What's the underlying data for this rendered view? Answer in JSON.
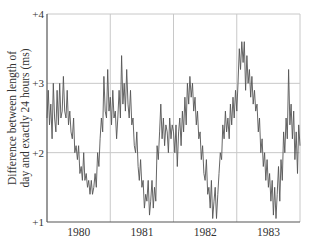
{
  "chart_data": {
    "type": "line",
    "title": "",
    "xlabel": "",
    "ylabel": "Difference between length of day and exactly 24 hours (ms)",
    "ylabel_lines": [
      "Difference between length of",
      "day and exactly 24 hours (ms)"
    ],
    "y_ticks": [
      {
        "value": 4,
        "label": "+4"
      },
      {
        "value": 3,
        "label": "+3"
      },
      {
        "value": 2,
        "label": "+2"
      },
      {
        "value": 1,
        "label": "+1"
      }
    ],
    "x_ticks": [
      {
        "value": 1980.5,
        "label": "1980"
      },
      {
        "value": 1981.5,
        "label": "1981"
      },
      {
        "value": 1982.5,
        "label": "1982"
      },
      {
        "value": 1983.5,
        "label": "1983"
      }
    ],
    "year_gridlines": [
      1981,
      1982,
      1983
    ],
    "xlim": [
      1980.0,
      1984.0
    ],
    "ylim": [
      1,
      4
    ],
    "grid": true,
    "legend": null,
    "series": [
      {
        "name": "Length-of-day excess (ms)",
        "color": "#555555",
        "x": [
          1980.0,
          1980.02,
          1980.04,
          1980.06,
          1980.08,
          1980.1,
          1980.12,
          1980.14,
          1980.16,
          1980.18,
          1980.2,
          1980.22,
          1980.24,
          1980.26,
          1980.28,
          1980.3,
          1980.32,
          1980.34,
          1980.36,
          1980.38,
          1980.4,
          1980.42,
          1980.44,
          1980.46,
          1980.48,
          1980.5,
          1980.52,
          1980.54,
          1980.56,
          1980.58,
          1980.6,
          1980.62,
          1980.64,
          1980.66,
          1980.68,
          1980.7,
          1980.72,
          1980.74,
          1980.76,
          1980.78,
          1980.8,
          1980.82,
          1980.84,
          1980.86,
          1980.88,
          1980.9,
          1980.92,
          1980.94,
          1980.96,
          1980.98,
          1981.0,
          1981.02,
          1981.04,
          1981.06,
          1981.08,
          1981.1,
          1981.12,
          1981.14,
          1981.16,
          1981.18,
          1981.2,
          1981.22,
          1981.24,
          1981.26,
          1981.28,
          1981.3,
          1981.32,
          1981.34,
          1981.36,
          1981.38,
          1981.4,
          1981.42,
          1981.44,
          1981.46,
          1981.48,
          1981.5,
          1981.52,
          1981.54,
          1981.56,
          1981.58,
          1981.6,
          1981.62,
          1981.64,
          1981.66,
          1981.68,
          1981.7,
          1981.72,
          1981.74,
          1981.76,
          1981.78,
          1981.8,
          1981.82,
          1981.84,
          1981.86,
          1981.88,
          1981.9,
          1981.92,
          1981.94,
          1981.96,
          1981.98,
          1982.0,
          1982.02,
          1982.04,
          1982.06,
          1982.08,
          1982.1,
          1982.12,
          1982.14,
          1982.16,
          1982.18,
          1982.2,
          1982.22,
          1982.24,
          1982.26,
          1982.28,
          1982.3,
          1982.32,
          1982.34,
          1982.36,
          1982.38,
          1982.4,
          1982.42,
          1982.44,
          1982.46,
          1982.48,
          1982.5,
          1982.52,
          1982.54,
          1982.56,
          1982.58,
          1982.6,
          1982.62,
          1982.64,
          1982.66,
          1982.68,
          1982.7,
          1982.72,
          1982.74,
          1982.76,
          1982.78,
          1982.8,
          1982.82,
          1982.84,
          1982.86,
          1982.88,
          1982.9,
          1982.92,
          1982.94,
          1982.96,
          1982.98,
          1983.0,
          1983.02,
          1983.04,
          1983.06,
          1983.08,
          1983.1,
          1983.12,
          1983.14,
          1983.16,
          1983.18,
          1983.2,
          1983.22,
          1983.24,
          1983.26,
          1983.28,
          1983.3,
          1983.32,
          1983.34,
          1983.36,
          1983.38,
          1983.4,
          1983.42,
          1983.44,
          1983.46,
          1983.48,
          1983.5,
          1983.52,
          1983.54,
          1983.56,
          1983.58,
          1983.6,
          1983.62,
          1983.64,
          1983.66,
          1983.68,
          1983.7,
          1983.72,
          1983.74,
          1983.76,
          1983.78,
          1983.8,
          1983.82,
          1983.84,
          1983.86,
          1983.88,
          1983.9,
          1983.92,
          1983.94,
          1983.96,
          1983.98,
          1984.0
        ],
        "y": [
          2.5,
          2.9,
          2.4,
          2.7,
          2.2,
          3.0,
          2.5,
          2.3,
          2.9,
          2.4,
          3.0,
          2.5,
          2.6,
          3.1,
          2.6,
          2.5,
          2.9,
          2.4,
          2.6,
          2.3,
          2.2,
          2.5,
          2.0,
          2.1,
          1.9,
          2.1,
          1.7,
          1.8,
          1.6,
          2.0,
          1.6,
          1.7,
          1.5,
          1.6,
          1.4,
          1.6,
          1.4,
          1.5,
          1.7,
          1.5,
          2.0,
          1.8,
          2.2,
          2.5,
          2.3,
          3.1,
          2.6,
          2.5,
          3.2,
          2.6,
          2.8,
          2.4,
          2.9,
          2.5,
          2.6,
          2.2,
          2.5,
          2.9,
          2.5,
          3.4,
          2.7,
          3.0,
          2.6,
          3.2,
          2.7,
          2.5,
          2.9,
          2.4,
          2.5,
          2.1,
          2.0,
          2.3,
          1.8,
          1.6,
          1.9,
          1.5,
          1.6,
          1.2,
          1.4,
          1.3,
          1.6,
          1.1,
          1.3,
          1.6,
          1.2,
          1.5,
          1.3,
          2.1,
          1.9,
          2.3,
          2.7,
          2.2,
          2.5,
          2.1,
          2.4,
          2.3,
          2.0,
          2.5,
          2.2,
          2.4,
          2.3,
          2.0,
          2.4,
          1.8,
          2.3,
          2.5,
          2.1,
          2.6,
          2.3,
          2.8,
          2.4,
          3.0,
          2.7,
          3.1,
          2.8,
          3.0,
          2.6,
          2.8,
          2.4,
          2.6,
          2.2,
          2.3,
          1.9,
          2.1,
          1.7,
          1.6,
          1.9,
          1.4,
          1.5,
          1.2,
          1.6,
          1.05,
          1.3,
          1.5,
          1.05,
          1.4,
          1.7,
          2.0,
          1.9,
          2.4,
          2.2,
          2.6,
          2.3,
          2.5,
          2.2,
          2.7,
          2.4,
          2.8,
          2.5,
          2.9,
          2.6,
          3.0,
          3.5,
          3.2,
          3.6,
          3.3,
          3.6,
          2.9,
          3.4,
          3.0,
          3.2,
          2.8,
          3.1,
          2.7,
          2.9,
          2.6,
          2.7,
          2.3,
          2.5,
          2.0,
          2.2,
          1.8,
          2.0,
          1.6,
          1.9,
          1.5,
          1.7,
          1.3,
          1.6,
          1.1,
          1.5,
          1.05,
          1.4,
          1.8,
          1.3,
          1.9,
          1.6,
          2.3,
          2.0,
          2.5,
          2.2,
          3.2,
          2.4,
          2.7,
          2.2,
          2.6,
          1.9,
          2.3,
          1.7,
          2.4,
          2.1
        ]
      }
    ]
  },
  "plot": {
    "left_px": 47,
    "right_px": 300,
    "top_px": 14,
    "bottom_px": 222,
    "axis_color": "#555555",
    "grid_color": "#c8c8c8",
    "line_color": "#555555"
  }
}
